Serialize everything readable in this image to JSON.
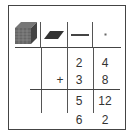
{
  "header": {
    "columns": [
      {
        "name": "thousands",
        "icon": "cube-icon"
      },
      {
        "name": "hundreds",
        "icon": "flat-icon"
      },
      {
        "name": "tens",
        "icon": "rod-icon"
      },
      {
        "name": "ones",
        "icon": "unit-icon"
      }
    ]
  },
  "problem": {
    "operator": "+",
    "addend1": {
      "tens": "2",
      "ones": "4"
    },
    "addend2": {
      "tens": "3",
      "ones": "8"
    },
    "partial": {
      "tens": "5",
      "ones": "12"
    },
    "result": {
      "tens": "6",
      "ones": "2"
    }
  },
  "colors": {
    "line": "#444444",
    "icon_fill": "#555555",
    "text": "#333333"
  }
}
